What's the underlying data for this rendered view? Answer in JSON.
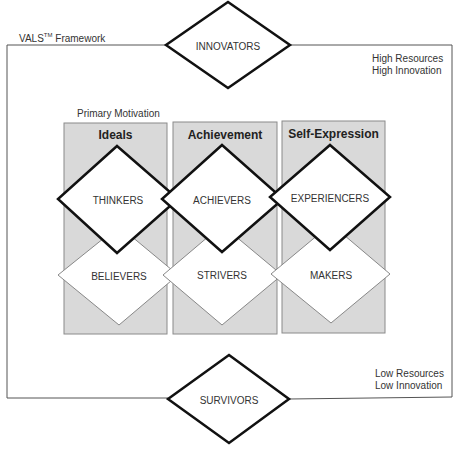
{
  "framework": {
    "title_prefix": "VALS",
    "title_tm": "TM",
    "title_suffix": " Framework"
  },
  "corners": {
    "high": [
      "High Resources",
      "High Innovation"
    ],
    "low": [
      "Low Resources",
      "Low Innovation"
    ]
  },
  "primary_motivation_label": "Primary Motivation",
  "columns": [
    {
      "header": "Ideals",
      "top_segment": "THINKERS",
      "bottom_segment": "BELIEVERS"
    },
    {
      "header": "Achievement",
      "top_segment": "ACHIEVERS",
      "bottom_segment": "STRIVERS"
    },
    {
      "header": "Self-Expression",
      "top_segment": "EXPERIENCERS",
      "bottom_segment": "MAKERS"
    }
  ],
  "top_segment": "INNOVATORS",
  "bottom_segment": "SURVIVORS",
  "colors": {
    "column_fill": "#d9d9d9",
    "column_border": "#8a8a8a",
    "frame_line": "#555555",
    "diamond_bold": "#111111",
    "diamond_thin": "#777777"
  }
}
